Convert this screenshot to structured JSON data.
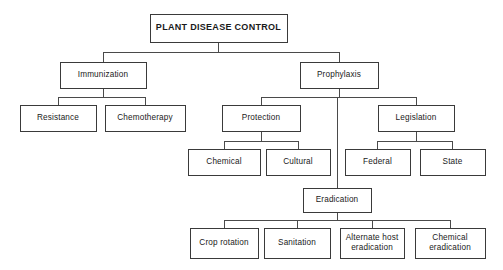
{
  "diagram": {
    "title": "PLANT DISEASE CONTROL",
    "type": "hierarchy-tree",
    "background_color": "#ffffff",
    "line_color": "#4a4a4a",
    "box_border_color": "#3a3a3a",
    "text_color": "#1a1a1a",
    "canvas": {
      "width": 503,
      "height": 270
    },
    "nodes": [
      {
        "id": "plant-disease-control",
        "label": "PLANT DISEASE CONTROL",
        "lines": [
          "PLANT DISEASE CONTROL"
        ],
        "level": 0,
        "bold": true,
        "x": 150,
        "y": 14,
        "w": 137,
        "h": 28
      },
      {
        "id": "immunization",
        "label": "Immunization",
        "lines": [
          "Immunization"
        ],
        "level": 1,
        "bold": false,
        "x": 60,
        "y": 62,
        "w": 86,
        "h": 26
      },
      {
        "id": "prophylaxis",
        "label": "Prophylaxis",
        "lines": [
          "Prophylaxis"
        ],
        "level": 1,
        "bold": false,
        "x": 300,
        "y": 62,
        "w": 78,
        "h": 26
      },
      {
        "id": "resistance",
        "label": "Resistance",
        "lines": [
          "Resistance"
        ],
        "level": 2,
        "bold": false,
        "x": 20,
        "y": 105,
        "w": 76,
        "h": 26
      },
      {
        "id": "chemotherapy",
        "label": "Chemotherapy",
        "lines": [
          "Chemotherapy"
        ],
        "level": 2,
        "bold": false,
        "x": 105,
        "y": 105,
        "w": 80,
        "h": 26
      },
      {
        "id": "protection",
        "label": "Protection",
        "lines": [
          "Protection"
        ],
        "level": 2,
        "bold": false,
        "x": 222,
        "y": 105,
        "w": 78,
        "h": 26
      },
      {
        "id": "legislation",
        "label": "Legislation",
        "lines": [
          "Legislation"
        ],
        "level": 2,
        "bold": false,
        "x": 378,
        "y": 105,
        "w": 76,
        "h": 26
      },
      {
        "id": "chemical",
        "label": "Chemical",
        "lines": [
          "Chemical"
        ],
        "level": 3,
        "bold": false,
        "x": 188,
        "y": 149,
        "w": 72,
        "h": 26
      },
      {
        "id": "cultural",
        "label": "Cultural",
        "lines": [
          "Cultural"
        ],
        "level": 3,
        "bold": false,
        "x": 266,
        "y": 149,
        "w": 64,
        "h": 26
      },
      {
        "id": "federal",
        "label": "Federal",
        "lines": [
          "Federal"
        ],
        "level": 3,
        "bold": false,
        "x": 345,
        "y": 149,
        "w": 65,
        "h": 26
      },
      {
        "id": "state",
        "label": "State",
        "lines": [
          "State"
        ],
        "level": 3,
        "bold": false,
        "x": 420,
        "y": 149,
        "w": 65,
        "h": 26
      },
      {
        "id": "eradication",
        "label": "Eradication",
        "lines": [
          "Eradication"
        ],
        "level": 2,
        "bold": false,
        "x": 303,
        "y": 188,
        "w": 68,
        "h": 24
      },
      {
        "id": "crop-rotation",
        "label": "Crop rotation",
        "lines": [
          "Crop rotation"
        ],
        "level": 3,
        "bold": false,
        "x": 190,
        "y": 228,
        "w": 68,
        "h": 30
      },
      {
        "id": "sanitation",
        "label": "Sanitation",
        "lines": [
          "Sanitation"
        ],
        "level": 3,
        "bold": false,
        "x": 264,
        "y": 228,
        "w": 66,
        "h": 30
      },
      {
        "id": "alternate-host-eradication",
        "label": "Alternate host eradication",
        "lines": [
          "Alternate host",
          "eradication"
        ],
        "level": 3,
        "bold": false,
        "x": 340,
        "y": 228,
        "w": 64,
        "h": 30
      },
      {
        "id": "chemical-eradication",
        "label": "Chemical eradication",
        "lines": [
          "Chemical",
          "eradication"
        ],
        "level": 3,
        "bold": false,
        "x": 415,
        "y": 228,
        "w": 70,
        "h": 30
      }
    ],
    "edges": [
      {
        "id": "root-to-immunization",
        "from": "plant-disease-control",
        "to": "immunization"
      },
      {
        "id": "root-to-prophylaxis",
        "from": "plant-disease-control",
        "to": "prophylaxis"
      },
      {
        "id": "immunization-to-resistance",
        "from": "immunization",
        "to": "resistance"
      },
      {
        "id": "immunization-to-chemotherapy",
        "from": "immunization",
        "to": "chemotherapy"
      },
      {
        "id": "prophylaxis-to-protection",
        "from": "prophylaxis",
        "to": "protection"
      },
      {
        "id": "prophylaxis-to-eradication",
        "from": "prophylaxis",
        "to": "eradication"
      },
      {
        "id": "prophylaxis-to-legislation",
        "from": "prophylaxis",
        "to": "legislation"
      },
      {
        "id": "protection-to-chemical",
        "from": "protection",
        "to": "chemical"
      },
      {
        "id": "protection-to-cultural",
        "from": "protection",
        "to": "cultural"
      },
      {
        "id": "legislation-to-federal",
        "from": "legislation",
        "to": "federal"
      },
      {
        "id": "legislation-to-state",
        "from": "legislation",
        "to": "state"
      },
      {
        "id": "eradication-to-crop-rotation",
        "from": "eradication",
        "to": "crop-rotation"
      },
      {
        "id": "eradication-to-sanitation",
        "from": "eradication",
        "to": "sanitation"
      },
      {
        "id": "eradication-to-alternate-host-eradication",
        "from": "eradication",
        "to": "alternate-host-eradication"
      },
      {
        "id": "eradication-to-chemical-eradication",
        "from": "eradication",
        "to": "chemical-eradication"
      }
    ],
    "connector_busbars": [
      {
        "id": "bus-root",
        "parent": "plant-disease-control",
        "bus_y": 52
      },
      {
        "id": "bus-immunization",
        "parent": "immunization",
        "bus_y": 97
      },
      {
        "id": "bus-prophylaxis",
        "parent": "prophylaxis",
        "bus_y": 97
      },
      {
        "id": "bus-protection",
        "parent": "protection",
        "bus_y": 141
      },
      {
        "id": "bus-legislation",
        "parent": "legislation",
        "bus_y": 141
      },
      {
        "id": "bus-eradication",
        "parent": "eradication",
        "bus_y": 220
      }
    ]
  }
}
